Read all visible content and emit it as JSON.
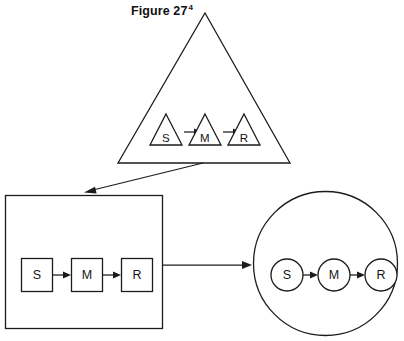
{
  "figure": {
    "title": "Figure 27",
    "title_superscript": "4",
    "background_color": "#ffffff",
    "stroke_color": "#1b1b1b",
    "text_color": "#141414",
    "width": 404,
    "height": 341
  },
  "chain_labels": {
    "stimulus": "S",
    "mediator": "M",
    "response": "R"
  },
  "panels": [
    {
      "id": "triangle-panel",
      "outer_shape": "triangle",
      "nodes": [
        {
          "label": "S",
          "shape": "triangle"
        },
        {
          "label": "M",
          "shape": "triangle"
        },
        {
          "label": "R",
          "shape": "triangle"
        }
      ]
    },
    {
      "id": "square-panel",
      "outer_shape": "square",
      "nodes": [
        {
          "label": "S",
          "shape": "square"
        },
        {
          "label": "M",
          "shape": "square"
        },
        {
          "label": "R",
          "shape": "square"
        }
      ]
    },
    {
      "id": "circle-panel",
      "outer_shape": "circle",
      "nodes": [
        {
          "label": "S",
          "shape": "circle"
        },
        {
          "label": "M",
          "shape": "circle"
        },
        {
          "label": "R",
          "shape": "circle"
        }
      ]
    }
  ],
  "connectors": [
    {
      "id": "triangle-to-square",
      "from": "triangle-panel",
      "to": "square-panel",
      "direction": "diagonal-down-left"
    },
    {
      "id": "square-to-circle",
      "from": "square-panel",
      "to": "circle-panel",
      "direction": "horizontal-right"
    }
  ]
}
